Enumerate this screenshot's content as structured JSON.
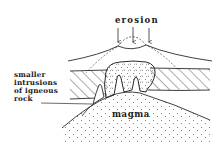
{
  "diagram": {
    "type": "geological cross-section",
    "labels": {
      "erosion": "erosion",
      "intrusions": [
        "smaller",
        "intrusions",
        "of igneous",
        "rock"
      ],
      "magma": "magma"
    },
    "colors": {
      "line": "#2a2a2a",
      "background": "#ffffff",
      "stipple": "#555555"
    },
    "arrows": {
      "count": 3,
      "direction": "down"
    }
  }
}
